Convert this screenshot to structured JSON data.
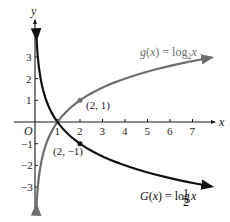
{
  "chart_data": {
    "type": "line",
    "title": "",
    "xlabel": "x",
    "ylabel": "y",
    "origin_label": "O",
    "xlim": [
      0,
      7.9
    ],
    "ylim": [
      -4,
      4
    ],
    "grid": false,
    "x_ticks": [
      1,
      2,
      3,
      4,
      5,
      6,
      7
    ],
    "y_ticks": [
      3,
      2,
      1,
      -1,
      -2,
      -3
    ],
    "series": [
      {
        "name": "g(x) = log_2 x",
        "label_main": "g(x) = log",
        "label_sub": "2",
        "label_var": "x",
        "color": "#6e6e6e",
        "function": "log2(x)",
        "x": [
          0.07,
          0.125,
          0.25,
          0.5,
          1,
          2,
          4,
          7.85
        ],
        "y": [
          -3.84,
          -3,
          -2,
          -1,
          0,
          1,
          2,
          2.97
        ]
      },
      {
        "name": "G(x) = log_(1/2) x",
        "label_main": "G(x) = log",
        "label_sub": "1/2",
        "label_sub_num": "1",
        "label_sub_den": "2",
        "label_var": "x",
        "color": "#111111",
        "function": "log_{1/2}(x)",
        "x": [
          0.07,
          0.125,
          0.25,
          0.5,
          1,
          2,
          4,
          7.85
        ],
        "y": [
          3.84,
          3,
          2,
          1,
          0,
          -1,
          -2,
          -2.97
        ]
      }
    ],
    "annotations": [
      {
        "text": "(2, 1)",
        "x": 2,
        "y": 1,
        "series": "g(x) = log_2 x"
      },
      {
        "text": "(2, −1)",
        "x": 2,
        "y": -1,
        "series": "G(x) = log_(1/2) x"
      }
    ]
  }
}
